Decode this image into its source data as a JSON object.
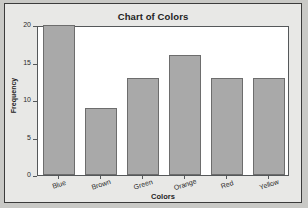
{
  "chart_data": {
    "type": "bar",
    "title": "Chart of Colors",
    "xlabel": "Colors",
    "ylabel": "Frequency",
    "categories": [
      "Blue",
      "Brown",
      "Green",
      "Orange",
      "Red",
      "Yellow"
    ],
    "values": [
      20,
      9,
      13,
      16,
      13,
      13
    ],
    "yticks": [
      0,
      5,
      10,
      15,
      20
    ],
    "ylim": [
      0,
      20
    ],
    "grid": false,
    "legend": "none",
    "colors": {
      "bar_fill": "#a9a9a9",
      "bar_edge": "#6d6d6d",
      "plot_background": "#ffffff",
      "figure_background": "#e8e8e6",
      "frame": "#55585a",
      "text": "#232323"
    }
  }
}
